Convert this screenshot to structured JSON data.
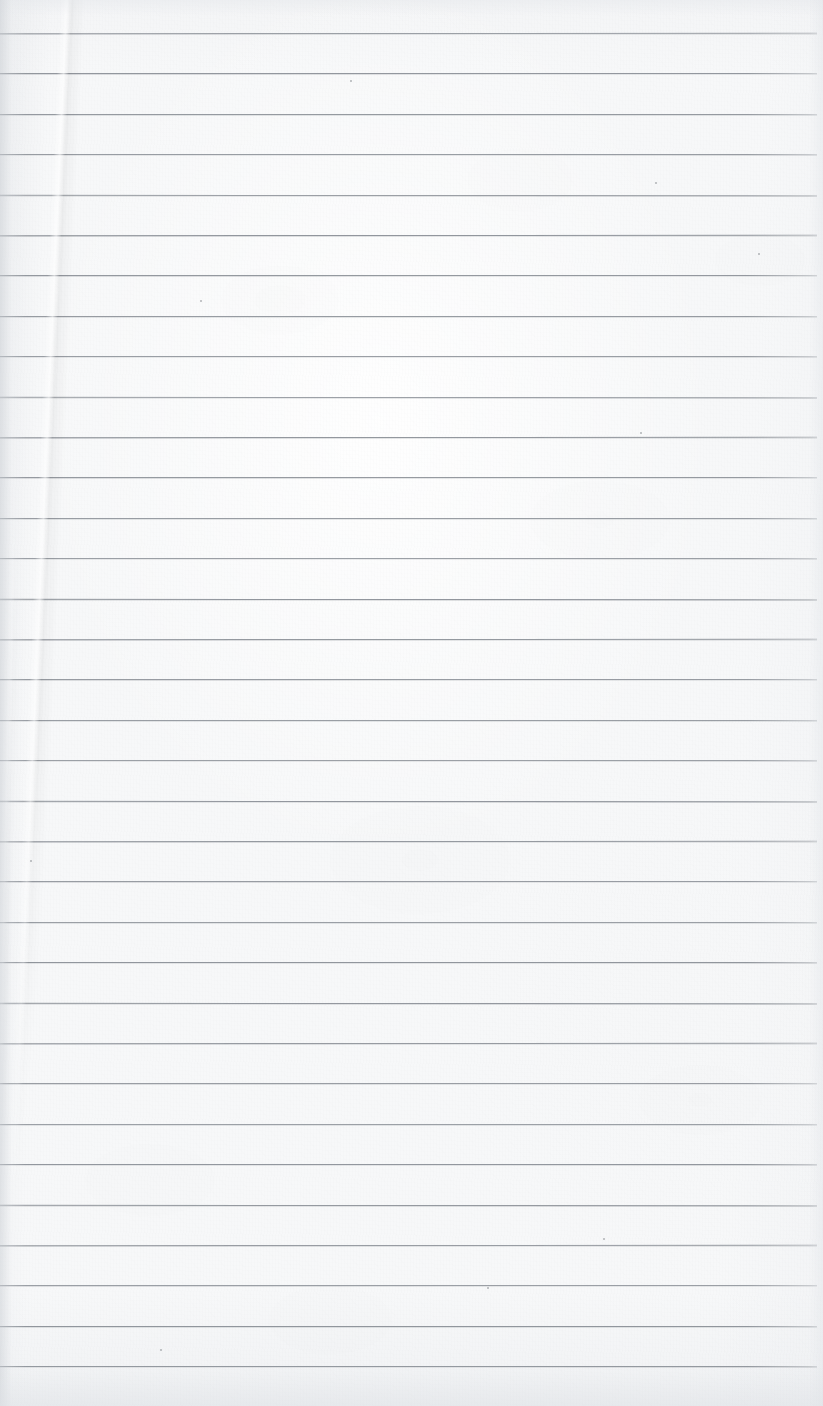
{
  "document": {
    "kind": "scanned-blank-ruled-paper",
    "title": "Blank Ruled Notebook Page",
    "has_text": false,
    "has_handwriting": false,
    "body_text": "",
    "page_width": 823,
    "page_height": 1406
  },
  "paper": {
    "background_color": "#f7f8f9",
    "edge_shadow_color": "#cdd1d6",
    "texture": "fibrous scanned paper with faint mottling"
  },
  "ruling": {
    "line_color": "#8b9097",
    "line_thickness_px": 1,
    "line_count": 34,
    "first_line_y": 33,
    "line_spacing_px": 40.4,
    "line_start_x": 0,
    "line_end_x": 817,
    "margin_rule": "none",
    "y_positions": [
      33,
      73.4,
      113.8,
      154.2,
      194.6,
      235,
      275.4,
      315.8,
      356.2,
      396.6,
      437,
      477.4,
      517.8,
      558.2,
      598.6,
      639,
      679.4,
      719.8,
      760.2,
      800.6,
      841,
      881.4,
      921.8,
      962.2,
      1002.6,
      1043,
      1083.4,
      1123.8,
      1164.2,
      1204.6,
      1245,
      1285.4,
      1325.8,
      1366.2
    ]
  },
  "artifacts": {
    "crease": {
      "label": "diagonal fold crease",
      "top_x": 105,
      "top_y": 0,
      "fade_out_y": 1130,
      "angle_deg": 2.6
    },
    "specks": [
      {
        "x": 350,
        "y": 80,
        "size": 2
      },
      {
        "x": 655,
        "y": 182,
        "size": 2
      },
      {
        "x": 758,
        "y": 253,
        "size": 2
      },
      {
        "x": 200,
        "y": 300,
        "size": 2
      },
      {
        "x": 640,
        "y": 432,
        "size": 2
      },
      {
        "x": 30,
        "y": 860,
        "size": 2
      },
      {
        "x": 603,
        "y": 1238,
        "size": 2
      },
      {
        "x": 160,
        "y": 1349,
        "size": 2
      },
      {
        "x": 487,
        "y": 1287,
        "size": 2
      }
    ]
  }
}
